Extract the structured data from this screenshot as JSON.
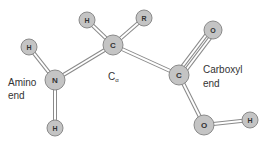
{
  "diagram": {
    "colors": {
      "atom_fill": "#c4c4c4",
      "atom_stroke": "#8a8a8a",
      "bond_stroke": "#8a8a8a",
      "bond_fill": "#ffffff",
      "text": "#333333"
    },
    "atoms": [
      {
        "id": "h_amino_top",
        "symbol": "H",
        "x": 29,
        "y": 47,
        "r": 8
      },
      {
        "id": "n",
        "symbol": "N",
        "x": 55,
        "y": 80,
        "r": 10
      },
      {
        "id": "h_amino_bottom",
        "symbol": "H",
        "x": 55,
        "y": 128,
        "r": 8
      },
      {
        "id": "c_alpha",
        "symbol": "C",
        "x": 113,
        "y": 45,
        "r": 10
      },
      {
        "id": "h_alpha",
        "symbol": "H",
        "x": 87,
        "y": 20,
        "r": 8
      },
      {
        "id": "r_group",
        "symbol": "R",
        "x": 144,
        "y": 18,
        "r": 8
      },
      {
        "id": "c_carboxyl",
        "symbol": "C",
        "x": 179,
        "y": 75,
        "r": 10
      },
      {
        "id": "o_double",
        "symbol": "O",
        "x": 213,
        "y": 30,
        "r": 9
      },
      {
        "id": "o_hydroxyl",
        "symbol": "O",
        "x": 204,
        "y": 125,
        "r": 10
      },
      {
        "id": "h_hydroxyl",
        "symbol": "H",
        "x": 250,
        "y": 120,
        "r": 8
      }
    ],
    "bonds": [
      {
        "from": "h_amino_top",
        "to": "n",
        "type": "single"
      },
      {
        "from": "n",
        "to": "h_amino_bottom",
        "type": "single"
      },
      {
        "from": "n",
        "to": "c_alpha",
        "type": "single"
      },
      {
        "from": "h_alpha",
        "to": "c_alpha",
        "type": "single"
      },
      {
        "from": "r_group",
        "to": "c_alpha",
        "type": "single"
      },
      {
        "from": "c_alpha",
        "to": "c_carboxyl",
        "type": "single"
      },
      {
        "from": "c_carboxyl",
        "to": "o_double",
        "type": "double"
      },
      {
        "from": "c_carboxyl",
        "to": "o_hydroxyl",
        "type": "single"
      },
      {
        "from": "o_hydroxyl",
        "to": "h_hydroxyl",
        "type": "single"
      }
    ],
    "labels": {
      "amino_line1": "Amino",
      "amino_line2": "end",
      "carboxyl_line1": "Carboxyl",
      "carboxyl_line2": "end",
      "c_alpha_main": "C",
      "c_alpha_sub": "α"
    }
  }
}
